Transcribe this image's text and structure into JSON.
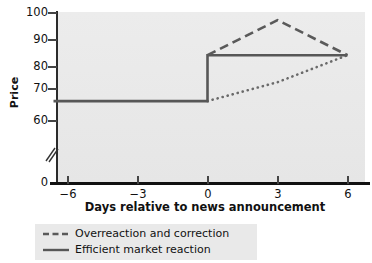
{
  "chart_data": {
    "type": "line",
    "title": "",
    "subtitle": "",
    "xlabel": "Days relative to news announcement",
    "ylabel": "Price",
    "xlim": [
      -7,
      7
    ],
    "ylim": [
      0,
      100
    ],
    "yticks": [
      "0",
      "60",
      "70",
      "80",
      "90",
      "100"
    ],
    "ytick_values": [
      0,
      60,
      70,
      80,
      90,
      100
    ],
    "xticks": [
      "−6",
      "−3",
      "0",
      "3",
      "6"
    ],
    "xtick_values": [
      -6,
      -3,
      0,
      3,
      6
    ],
    "grid": false,
    "axis_break": true,
    "axis_break_note": "y-axis broken between 0 and 60",
    "legend_position": "below-left",
    "series": [
      {
        "name": "Overreaction and correction",
        "style": "dashed",
        "color": "#5a5a5a",
        "x": [
          0,
          3,
          6
        ],
        "values": [
          84,
          97,
          84
        ]
      },
      {
        "name": "Efficient market reaction",
        "style": "solid",
        "color": "#555555",
        "x": [
          -6.6,
          0,
          0,
          6
        ],
        "values": [
          67,
          67,
          84,
          84
        ]
      },
      {
        "name": "Delayed reaction",
        "style": "dotted",
        "color": "#6a6a6a",
        "x": [
          0,
          3,
          6
        ],
        "values": [
          67,
          74,
          84
        ]
      }
    ]
  },
  "axes": {
    "ylabel": "Price",
    "xlabel": "Days relative to news announcement",
    "ytick_labels": [
      "100",
      "90",
      "80",
      "70",
      "60",
      "0"
    ],
    "xtick_labels": [
      "−6",
      "−3",
      "0",
      "3",
      "6"
    ]
  },
  "legend": {
    "items": [
      {
        "label": "Overreaction and correction",
        "style": "dashed"
      },
      {
        "label": "Efficient market reaction",
        "style": "solid"
      }
    ]
  },
  "colors": {
    "plot_background": "#e9e9e9",
    "axis": "#111111",
    "line": "#575757",
    "page_background": "#ffffff"
  }
}
